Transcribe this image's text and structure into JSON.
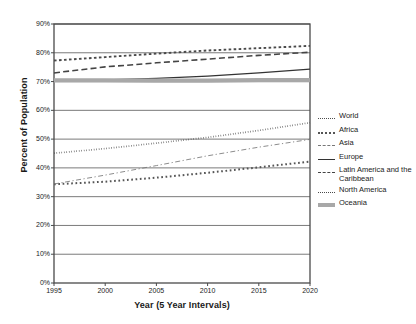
{
  "chart_data": {
    "type": "line",
    "title": "",
    "xlabel": "Year (5 Year Intervals)",
    "ylabel": "Percent of Population",
    "x": [
      1995,
      2000,
      2005,
      2010,
      2015,
      2020
    ],
    "xlim": [
      1995,
      2020
    ],
    "ylim": [
      0,
      90
    ],
    "ytick_labels": [
      "0%",
      "10%",
      "20%",
      "30%",
      "40%",
      "50%",
      "60%",
      "70%",
      "80%",
      "90%"
    ],
    "ytick_values": [
      0,
      10,
      20,
      30,
      40,
      50,
      60,
      70,
      80,
      90
    ],
    "xtick_labels": [
      "1995",
      "2000",
      "2005",
      "2010",
      "2015",
      "2020"
    ],
    "grid": true,
    "grid_axis": "y",
    "legend_position": "right",
    "series": [
      {
        "name": "World",
        "style": "fine-dotted",
        "color": "#4d4d4d",
        "values": [
          45.1,
          46.7,
          48.6,
          50.6,
          53.0,
          55.7
        ]
      },
      {
        "name": "Africa",
        "style": "square-dotted",
        "color": "#555555",
        "values": [
          34.3,
          35.2,
          36.6,
          38.3,
          40.2,
          42.2
        ]
      },
      {
        "name": "Asia",
        "style": "thin-dash-dot",
        "color": "#777777",
        "values": [
          34.4,
          37.5,
          40.8,
          44.2,
          47.2,
          49.9
        ]
      },
      {
        "name": "Europe",
        "style": "solid",
        "color": "#333333",
        "values": [
          70.2,
          70.6,
          71.1,
          71.9,
          73.0,
          74.3
        ]
      },
      {
        "name": "Latin America and the Caribbean",
        "style": "long-dashed",
        "color": "#444444",
        "values": [
          73.0,
          75.1,
          76.5,
          77.8,
          79.1,
          80.2
        ]
      },
      {
        "name": "North America",
        "style": "medium-dotted",
        "color": "#4a4a4a",
        "values": [
          77.3,
          78.5,
          79.7,
          80.8,
          81.6,
          82.4
        ]
      },
      {
        "name": "Oceania",
        "style": "thick-band",
        "color": "#a8a8a8",
        "values": [
          70.4,
          70.4,
          70.3,
          70.3,
          70.5,
          70.5
        ]
      }
    ]
  },
  "legend": {
    "items": [
      {
        "label": "World",
        "swatch": "fine-dotted-swatch"
      },
      {
        "label": "Africa",
        "swatch": "square-dotted-swatch"
      },
      {
        "label": "Asia",
        "swatch": "dash-dot-swatch"
      },
      {
        "label": "Europe",
        "swatch": "solid-swatch"
      },
      {
        "label": "Latin America and the Caribbean",
        "swatch": "long-dashed-swatch"
      },
      {
        "label": "North America",
        "swatch": "medium-dotted-swatch"
      },
      {
        "label": "Oceania",
        "swatch": "thick-band-swatch"
      }
    ]
  },
  "colors": {
    "frame": "#4a4a4a",
    "gridline": "#6b6b6b",
    "background": "#ffffff",
    "text": "#1a1a1a"
  }
}
